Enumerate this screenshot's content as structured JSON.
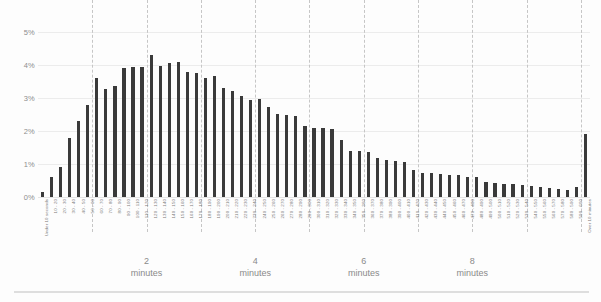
{
  "chart_data": {
    "type": "bar",
    "title": "",
    "subtitle": "",
    "xlabel": "",
    "ylabel": "",
    "ylim": [
      0,
      5
    ],
    "ytick_labels": [
      "0%",
      "1%",
      "2%",
      "3%",
      "4%",
      "5%"
    ],
    "ytick_values": [
      0,
      1,
      2,
      3,
      4,
      5
    ],
    "grid": true,
    "grid_axis": "both",
    "legend": false,
    "bar_color": "#3a3a3a",
    "minute_markers": [
      {
        "label_num": "2",
        "label_word": "minutes",
        "seconds": 120
      },
      {
        "label_num": "4",
        "label_word": "minutes",
        "seconds": 240
      },
      {
        "label_num": "6",
        "label_word": "minutes",
        "seconds": 360
      },
      {
        "label_num": "8",
        "label_word": "minutes",
        "seconds": 480
      }
    ],
    "minute_gridlines_seconds": [
      60,
      120,
      180,
      240,
      300,
      360,
      420,
      480,
      540,
      600
    ],
    "categories": [
      "Under 10 seconds",
      "10 - 20",
      "20 - 30",
      "30 - 40",
      "40 - 50",
      "50 - 60",
      "60 - 70",
      "70 - 80",
      "80 - 90",
      "90 - 100",
      "100 - 110",
      "110 - 120",
      "120 - 130",
      "130 - 140",
      "140 - 150",
      "150 - 160",
      "160 - 170",
      "170 - 180",
      "180 - 190",
      "190 - 200",
      "200 - 210",
      "210 - 220",
      "220 - 230",
      "230 - 240",
      "240 - 250",
      "250 - 260",
      "260 - 270",
      "270 - 280",
      "280 - 290",
      "290 - 300",
      "300 - 310",
      "310 - 320",
      "320 - 330",
      "330 - 340",
      "340 - 350",
      "350 - 360",
      "360 - 370",
      "370 - 380",
      "380 - 390",
      "390 - 400",
      "400 - 410",
      "410 - 420",
      "420 - 430",
      "430 - 440",
      "440 - 450",
      "450 - 460",
      "460 - 470",
      "470 - 480",
      "480 - 490",
      "490 - 500",
      "500 - 510",
      "510 - 520",
      "520 - 530",
      "530 - 540",
      "540 - 550",
      "550 - 560",
      "560 - 570",
      "570 - 580",
      "580 - 590",
      "590 - 600",
      "Over 10 minutes"
    ],
    "values": [
      0.15,
      0.6,
      0.92,
      1.8,
      2.3,
      2.8,
      3.6,
      3.28,
      3.35,
      3.9,
      3.93,
      3.95,
      4.3,
      3.98,
      4.05,
      4.1,
      3.8,
      3.75,
      3.6,
      3.68,
      3.3,
      3.2,
      3.05,
      2.95,
      2.98,
      2.72,
      2.52,
      2.5,
      2.45,
      2.15,
      2.1,
      2.1,
      2.05,
      1.72,
      1.4,
      1.38,
      1.35,
      1.18,
      1.12,
      1.1,
      1.05,
      0.82,
      0.72,
      0.72,
      0.7,
      0.68,
      0.68,
      0.62,
      0.6,
      0.45,
      0.42,
      0.4,
      0.38,
      0.35,
      0.32,
      0.3,
      0.28,
      0.25,
      0.22,
      0.3,
      1.9
    ]
  }
}
